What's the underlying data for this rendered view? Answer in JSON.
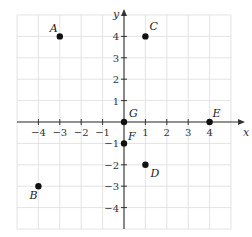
{
  "chart_data": {
    "type": "scatter",
    "title": "",
    "xlabel": "x",
    "ylabel": "y",
    "xlim": [
      -5,
      5
    ],
    "ylim": [
      -5,
      5
    ],
    "grid": true,
    "x_ticks": [
      -4,
      -3,
      -2,
      -1,
      1,
      2,
      3,
      4
    ],
    "y_ticks": [
      4,
      3,
      2,
      1,
      -1,
      -2,
      -3,
      -4
    ],
    "x_tick_labels": [
      "−4",
      "−3",
      "−2",
      "−1",
      "1",
      "2",
      "3",
      "4"
    ],
    "y_tick_labels": [
      "4",
      "3",
      "2",
      "1",
      "−1",
      "−2",
      "−3",
      "−4"
    ],
    "points": [
      {
        "label": "A",
        "x": -3,
        "y": 4
      },
      {
        "label": "B",
        "x": -4,
        "y": -3
      },
      {
        "label": "C",
        "x": 1,
        "y": 4
      },
      {
        "label": "D",
        "x": 1,
        "y": -2
      },
      {
        "label": "E",
        "x": 4,
        "y": 0
      },
      {
        "label": "F",
        "x": 0,
        "y": -1
      },
      {
        "label": "G",
        "x": 0,
        "y": 0
      }
    ]
  },
  "style": {
    "point_color": "#111111",
    "grid_color": "#dcdcdc",
    "axis_color": "#333333"
  }
}
